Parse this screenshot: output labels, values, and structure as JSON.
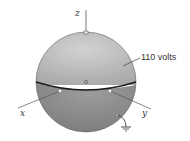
{
  "diagram": {
    "axes": {
      "z": "z",
      "x": "x",
      "y": "y"
    },
    "upper_hemisphere_label": "110 volts",
    "colors": {
      "upper_hemisphere": "#bdbdbd",
      "lower_hemisphere": "#8e8e8e",
      "equator": "#1a1a1a",
      "axis": "#555555"
    }
  }
}
